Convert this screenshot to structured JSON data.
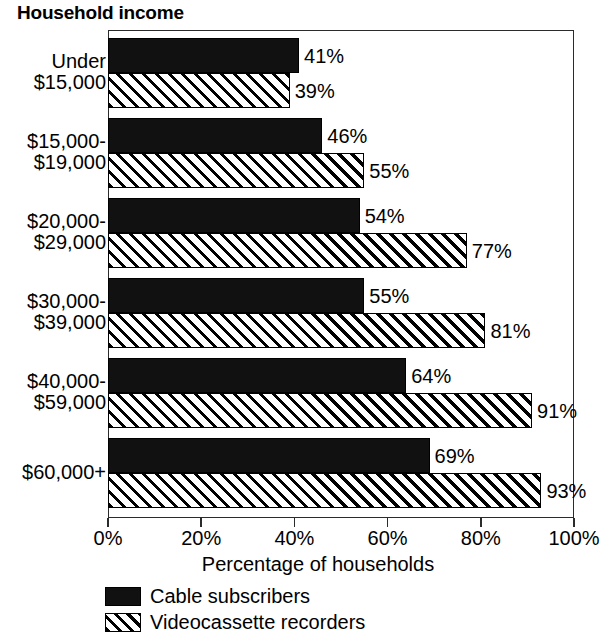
{
  "chart_data": {
    "type": "bar",
    "orientation": "horizontal",
    "title": "Household income",
    "xlabel": "Percentage of households",
    "ylabel": "",
    "xlim": [
      0,
      100
    ],
    "xticks": [
      "0%",
      "20%",
      "40%",
      "60%",
      "80%",
      "100%"
    ],
    "xtick_values": [
      0,
      20,
      40,
      60,
      80,
      100
    ],
    "grid": false,
    "legend_position": "bottom-left",
    "categories": [
      "Under $15,000",
      "$15,000-$19,000",
      "$20,000-$29,000",
      "$30,000-$39,000",
      "$40,000-$59,000",
      "$60,000+"
    ],
    "category_lines": [
      [
        "Under",
        "$15,000"
      ],
      [
        "$15,000-",
        "$19,000"
      ],
      [
        "$20,000-",
        "$29,000"
      ],
      [
        "$30,000-",
        "$39,000"
      ],
      [
        "$40,000-",
        "$59,000"
      ],
      [
        "$60,000+"
      ]
    ],
    "series": [
      {
        "name": "Cable subscribers",
        "style": "solid-black",
        "color": "#111111",
        "values": [
          41,
          46,
          54,
          55,
          64,
          69
        ],
        "labels": [
          "41%",
          "46%",
          "54%",
          "55%",
          "64%",
          "69%"
        ]
      },
      {
        "name": "Videocassette recorders",
        "style": "diagonal-hatch",
        "color": "#ffffff",
        "values": [
          39,
          55,
          77,
          81,
          91,
          93
        ],
        "labels": [
          "39%",
          "55%",
          "77%",
          "81%",
          "91%",
          "93%"
        ]
      }
    ]
  },
  "legend": {
    "items": [
      {
        "label": "Cable subscribers"
      },
      {
        "label": "Videocassette recorders"
      }
    ]
  }
}
